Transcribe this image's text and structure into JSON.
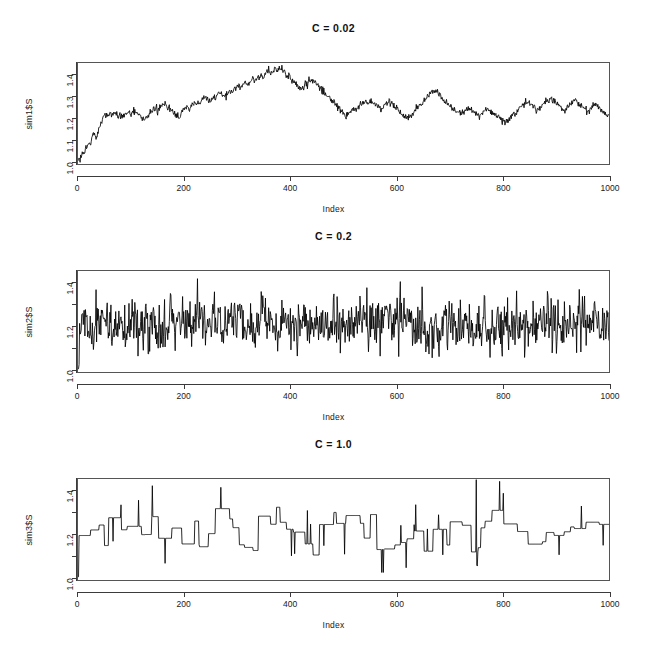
{
  "figure": {
    "width": 667,
    "height": 649,
    "background": "#ffffff",
    "foreground": "#000000",
    "panel_count": 3
  },
  "panels": [
    {
      "title": "C = 0.02",
      "ylabel": "sim1$S",
      "xlabel": "Index",
      "ytick_labels": [
        "1.0",
        "1.1",
        "1.2",
        "1.3",
        "1.4"
      ],
      "ytick_values": [
        1.0,
        1.1,
        1.2,
        1.3,
        1.4
      ],
      "xtick_labels": [
        "0",
        "200",
        "400",
        "600",
        "800",
        "1000"
      ],
      "xtick_values": [
        0,
        200,
        400,
        600,
        800,
        1000
      ]
    },
    {
      "title": "C = 0.2",
      "ylabel": "sim2$S",
      "xlabel": "Index",
      "ytick_labels": [
        "1.0",
        "",
        "1.2",
        "",
        "1.4"
      ],
      "ytick_values": [
        1.0,
        1.1,
        1.2,
        1.3,
        1.4
      ],
      "xtick_labels": [
        "0",
        "200",
        "400",
        "600",
        "800",
        "1000"
      ],
      "xtick_values": [
        0,
        200,
        400,
        600,
        800,
        1000
      ]
    },
    {
      "title": "C = 1.0",
      "ylabel": "sim3$S",
      "xlabel": "Index",
      "ytick_labels": [
        "1.0",
        "",
        "1.2",
        "",
        "1.4"
      ],
      "ytick_values": [
        1.0,
        1.1,
        1.2,
        1.3,
        1.4
      ],
      "xtick_labels": [
        "0",
        "200",
        "400",
        "600",
        "800",
        "1000"
      ],
      "xtick_values": [
        0,
        200,
        400,
        600,
        800,
        1000
      ]
    }
  ],
  "chart_data": [
    {
      "type": "line",
      "title": "C = 0.02",
      "xlabel": "Index",
      "ylabel": "sim1$S",
      "xlim": [
        0,
        1000
      ],
      "ylim": [
        0.985,
        1.455
      ],
      "grid": false,
      "legend": null,
      "line_color": "#000000",
      "description": "Smooth random walk: rises from 1.00 at index 0 to about 1.22 by index 60, drifts up to a peak near 1.43 around index 285, then declines and fluctuates between 1.15 and 1.33 for the rest of the series, ending near 1.27.",
      "x": [
        0,
        5,
        10,
        15,
        20,
        25,
        30,
        35,
        40,
        45,
        50,
        55,
        60,
        65,
        70,
        75,
        80,
        85,
        90,
        95,
        100,
        105,
        110,
        115,
        120,
        125,
        130,
        135,
        140,
        145,
        150,
        155,
        160,
        165,
        170,
        175,
        180,
        185,
        190,
        195,
        200,
        205,
        210,
        215,
        220,
        225,
        230,
        235,
        240,
        245,
        250,
        255,
        260,
        265,
        270,
        275,
        280,
        285,
        290,
        295,
        300,
        305,
        310,
        315,
        320,
        325,
        330,
        335,
        340,
        345,
        350,
        355,
        360,
        365,
        370,
        375,
        380,
        385,
        390,
        395,
        400,
        405,
        410,
        415,
        420,
        425,
        430,
        435,
        440,
        445,
        450,
        455,
        460,
        465,
        470,
        475,
        480,
        485,
        490,
        495,
        500,
        505,
        510,
        515,
        520,
        525,
        530,
        535,
        540,
        545,
        550,
        555,
        560,
        565,
        570,
        575,
        580,
        585,
        590,
        595,
        600,
        605,
        610,
        615,
        620,
        625,
        630,
        635,
        640,
        645,
        650,
        655,
        660,
        665,
        670,
        675,
        680,
        685,
        690,
        695,
        700,
        705,
        710,
        715,
        720,
        725,
        730,
        735,
        740,
        745,
        750,
        755,
        760,
        765,
        770,
        775,
        780,
        785,
        790,
        795,
        800,
        805,
        810,
        815,
        820,
        825,
        830,
        835,
        840,
        845,
        850,
        855,
        860,
        865,
        870,
        875,
        880,
        885,
        890,
        895,
        900,
        905,
        910,
        915,
        920,
        925,
        930,
        935,
        940,
        945,
        950,
        955,
        960,
        965,
        970,
        975,
        980,
        985,
        990,
        995,
        1000
      ],
      "y": [
        1.0,
        1.012,
        1.03,
        1.052,
        1.078,
        1.096,
        1.13,
        1.112,
        1.152,
        1.186,
        1.212,
        1.206,
        1.224,
        1.216,
        1.222,
        1.208,
        1.214,
        1.206,
        1.218,
        1.23,
        1.222,
        1.234,
        1.226,
        1.212,
        1.196,
        1.184,
        1.206,
        1.222,
        1.234,
        1.246,
        1.238,
        1.25,
        1.262,
        1.254,
        1.246,
        1.238,
        1.226,
        1.214,
        1.204,
        1.222,
        1.238,
        1.252,
        1.244,
        1.256,
        1.268,
        1.276,
        1.268,
        1.28,
        1.292,
        1.284,
        1.276,
        1.288,
        1.3,
        1.312,
        1.306,
        1.296,
        1.31,
        1.324,
        1.318,
        1.332,
        1.346,
        1.338,
        1.352,
        1.366,
        1.358,
        1.372,
        1.384,
        1.376,
        1.39,
        1.402,
        1.394,
        1.408,
        1.42,
        1.412,
        1.426,
        1.418,
        1.43,
        1.422,
        1.41,
        1.396,
        1.384,
        1.372,
        1.358,
        1.344,
        1.33,
        1.344,
        1.356,
        1.368,
        1.38,
        1.372,
        1.358,
        1.344,
        1.33,
        1.316,
        1.302,
        1.288,
        1.276,
        1.262,
        1.248,
        1.236,
        1.224,
        1.212,
        1.222,
        1.234,
        1.246,
        1.238,
        1.252,
        1.264,
        1.276,
        1.268,
        1.28,
        1.272,
        1.26,
        1.248,
        1.236,
        1.248,
        1.262,
        1.274,
        1.266,
        1.254,
        1.242,
        1.23,
        1.218,
        1.206,
        1.194,
        1.206,
        1.22,
        1.234,
        1.248,
        1.262,
        1.276,
        1.29,
        1.302,
        1.314,
        1.326,
        1.318,
        1.306,
        1.294,
        1.282,
        1.27,
        1.258,
        1.246,
        1.236,
        1.226,
        1.216,
        1.226,
        1.238,
        1.25,
        1.242,
        1.232,
        1.222,
        1.212,
        1.222,
        1.234,
        1.246,
        1.238,
        1.228,
        1.218,
        1.208,
        1.198,
        1.188,
        1.178,
        1.19,
        1.202,
        1.214,
        1.226,
        1.238,
        1.25,
        1.262,
        1.274,
        1.266,
        1.254,
        1.242,
        1.232,
        1.244,
        1.256,
        1.268,
        1.28,
        1.292,
        1.284,
        1.272,
        1.26,
        1.248,
        1.236,
        1.246,
        1.258,
        1.27,
        1.282,
        1.274,
        1.262,
        1.25,
        1.238,
        1.226,
        1.238,
        1.25,
        1.264,
        1.252,
        1.24,
        1.228,
        1.216,
        1.206,
        1.196,
        1.186,
        1.176,
        1.188,
        1.2,
        1.214,
        1.228,
        1.242,
        1.256,
        1.248,
        1.262,
        1.276,
        1.268,
        1.256,
        1.244,
        1.256,
        1.27,
        1.284,
        1.298,
        1.29,
        1.278,
        1.29,
        1.302,
        1.316,
        1.308,
        1.296,
        1.284,
        1.272,
        1.284,
        1.296,
        1.284,
        1.272,
        1.262,
        1.274,
        1.286,
        1.298,
        1.312,
        1.326,
        1.318,
        1.306,
        1.294,
        1.282,
        1.27,
        1.278,
        1.268
      ]
    },
    {
      "type": "line",
      "title": "C = 0.2",
      "xlabel": "Index",
      "ylabel": "sim2$S",
      "xlim": [
        0,
        1000
      ],
      "ylim": [
        0.985,
        1.455
      ],
      "grid": false,
      "legend": null,
      "line_color": "#000000",
      "description": "High-frequency noisy series: starts at 1.00, jumps to about 1.15 within the first 15 indices, then oscillates rapidly with most values between 1.08 and 1.35, mean near 1.21, with occasional excursions to 1.42 and down to 1.05.",
      "mean": 1.21,
      "min": 1.0,
      "max": 1.43,
      "noise_scale": 0.2
    },
    {
      "type": "line",
      "title": "C = 1.0",
      "xlabel": "Index",
      "ylabel": "sim3$S",
      "xlim": [
        0,
        1000
      ],
      "ylim": [
        0.985,
        1.455
      ],
      "grid": false,
      "legend": null,
      "line_color": "#000000",
      "description": "Piecewise-constant step series: starts at 1.00, jumps to about 1.20 and then holds long flat plateaus between 1.10 and 1.32, punctuated by narrow single-index spikes; the largest spike reaches about 1.45 near index 750 and drops to about 1.05 immediately after.",
      "mean": 1.21,
      "min": 1.0,
      "max": 1.46,
      "noise_scale": 1.0
    }
  ]
}
